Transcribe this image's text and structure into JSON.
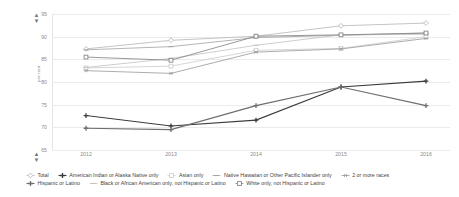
{
  "controls": {
    "top_spinner": {
      "up": "▲",
      "down": "▼",
      "name": "y-axis-max-spinner"
    },
    "bottom_spinner": {
      "up": "▲",
      "down": "▼",
      "name": "y-axis-min-spinner"
    }
  },
  "chart_data": {
    "type": "line",
    "title": "",
    "xlabel": "",
    "ylabel": "per cent",
    "x": [
      "2012",
      "2013",
      "2014",
      "2015",
      "2016"
    ],
    "categories": [
      "2012",
      "2013",
      "2014",
      "2015",
      "2016"
    ],
    "ylim": [
      65,
      95
    ],
    "yticks": [
      65,
      70,
      75,
      80,
      85,
      90,
      95
    ],
    "grid": true,
    "legend_position": "bottom",
    "series": [
      {
        "name": "Total",
        "marker": "diamond",
        "color": "#b9b9b9",
        "values": [
          87.3,
          89.2,
          90.1,
          92.4,
          93.0
        ]
      },
      {
        "name": "American Indian or Alaska Native only",
        "marker": "plus",
        "color": "#3c3c3c",
        "values": [
          72.6,
          70.3,
          71.6,
          78.9,
          80.2
        ]
      },
      {
        "name": "Asian only",
        "marker": "square",
        "color": "#cfcfcf",
        "values": [
          83.1,
          83.5,
          87.0,
          87.4,
          90.0
        ]
      },
      {
        "name": "Native Hawaiian or Other Pacific Islander only",
        "marker": "line",
        "color": "#a7a7a7",
        "values": [
          87.1,
          87.8,
          89.8,
          90.3,
          90.8
        ]
      },
      {
        "name": "2 or more races",
        "marker": "asterisk",
        "color": "#9e9e9e",
        "values": [
          82.5,
          81.9,
          86.6,
          87.3,
          89.6
        ]
      },
      {
        "name": "Hispanic or Latino",
        "marker": "plus",
        "color": "#6e6e6e",
        "values": [
          69.8,
          69.5,
          74.8,
          78.9,
          74.8
        ]
      },
      {
        "name": "Black or African American only, not Hispanic or Latino",
        "marker": "line",
        "color": "#c4c4c4",
        "values": [
          83.2,
          85.2,
          88.1,
          90.4,
          90.5
        ]
      },
      {
        "name": "White only, not Hispanic or Latino",
        "marker": "square",
        "color": "#878787",
        "values": [
          85.5,
          84.8,
          90.1,
          90.4,
          90.8
        ]
      }
    ]
  }
}
